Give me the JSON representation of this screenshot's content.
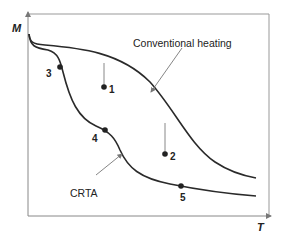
{
  "axes": {
    "y_label": "M",
    "x_label": "T"
  },
  "curves": [
    {
      "name": "Conventional heating",
      "label": "Conventional heating"
    },
    {
      "name": "CRTA",
      "label": "CRTA"
    }
  ],
  "points": [
    {
      "id": "1",
      "label": "1"
    },
    {
      "id": "2",
      "label": "2"
    },
    {
      "id": "3",
      "label": "3"
    },
    {
      "id": "4",
      "label": "4"
    },
    {
      "id": "5",
      "label": "5"
    }
  ],
  "colors": {
    "curve": "#2a2a2a",
    "axis": "#8a8a8a",
    "annotation": "#777777"
  }
}
